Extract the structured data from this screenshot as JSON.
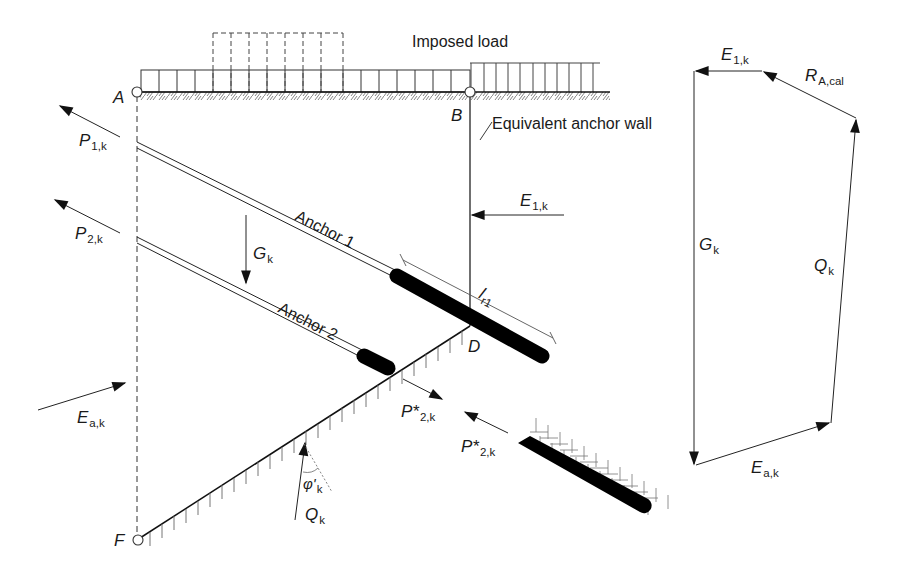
{
  "figure": {
    "texts": {
      "imposed_load": "Imposed load",
      "equivalent_anchor_wall": "Equivalent anchor wall",
      "anchor_1": "Anchor 1",
      "anchor_2": "Anchor 2"
    },
    "points": {
      "A": "A",
      "B": "B",
      "D": "D",
      "F": "F"
    },
    "forces": {
      "P1k": {
        "main": "P",
        "sub": "1,k"
      },
      "P2k": {
        "main": "P",
        "sub": "2,k"
      },
      "Gk": {
        "main": "G",
        "sub": "k"
      },
      "E1k": {
        "main": "E",
        "sub": "1,k"
      },
      "Eak": {
        "main": "E",
        "sub": "a,k"
      },
      "P2k_star_a": {
        "main": "P*",
        "sub": "2,k"
      },
      "P2k_star_b": {
        "main": "P*",
        "sub": "2,k"
      },
      "Qk": {
        "main": "Q",
        "sub": "k"
      },
      "phi": {
        "main": "φ'",
        "sub": "k"
      },
      "lr1": {
        "main": "l",
        "sub": "r1"
      }
    },
    "force_polygon": {
      "E1k": {
        "main": "E",
        "sub": "1,k"
      },
      "RAcal": {
        "main": "R",
        "sub": "A,cal"
      },
      "Gk": {
        "main": "G",
        "sub": "k"
      },
      "Qk": {
        "main": "Q",
        "sub": "k"
      },
      "Eak": {
        "main": "E",
        "sub": "a,k"
      }
    },
    "colors": {
      "line": "#1a1a1a",
      "hatch": "#555555",
      "grout": "#000000",
      "background": "#ffffff"
    }
  }
}
